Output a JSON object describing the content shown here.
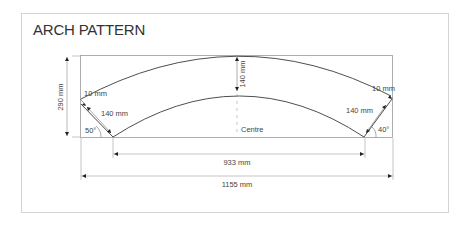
{
  "title": "ARCH PATTERN",
  "labels": {
    "height": "290 mm",
    "rise": "140 mm",
    "left_thickness": "10 mm",
    "left_width": "140 mm",
    "left_angle": "50°",
    "right_thickness": "10 mm",
    "right_width": "140 mm",
    "right_angle": "40°",
    "centre": "Centre",
    "inner_span": "933 mm",
    "total_span": "1155 mm"
  },
  "colors": {
    "line": "#3a3a3a",
    "dim_line": "#8a8a8a",
    "frame": "#d4d4d4",
    "text": "#333333"
  }
}
